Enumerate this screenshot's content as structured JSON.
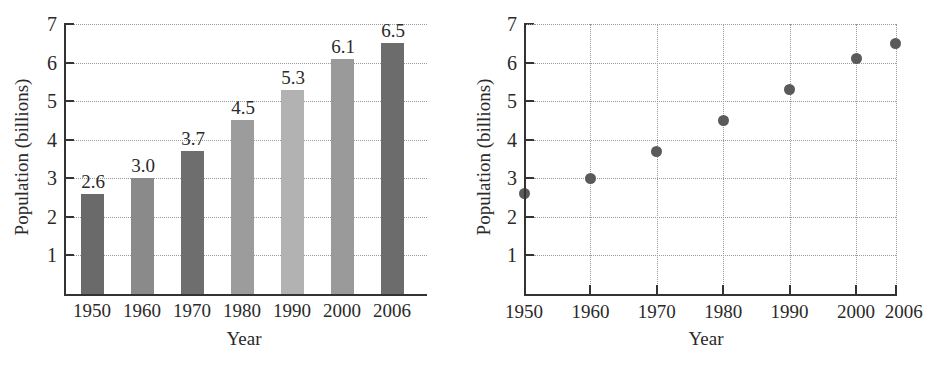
{
  "chart_data": [
    {
      "type": "bar",
      "title": "",
      "xlabel": "Year",
      "ylabel": "Population (billions)",
      "categories": [
        "1950",
        "1960",
        "1970",
        "1980",
        "1990",
        "2000",
        "2006"
      ],
      "values": [
        2.6,
        3.0,
        3.7,
        4.5,
        5.3,
        6.1,
        6.5
      ],
      "data_labels": [
        "2.6",
        "3.0",
        "3.7",
        "4.5",
        "5.3",
        "6.1",
        "6.5"
      ],
      "bar_colors": [
        "#6a6a6a",
        "#8a8a8a",
        "#6e6e6e",
        "#9c9c9c",
        "#b2b2b2",
        "#9a9a9a",
        "#6c6c6c"
      ],
      "ylim": [
        0,
        7
      ],
      "yticks": [
        "1",
        "2",
        "3",
        "4",
        "5",
        "6",
        "7"
      ],
      "grid": "horizontal dotted",
      "legend": null
    },
    {
      "type": "scatter",
      "title": "",
      "xlabel": "Year",
      "ylabel": "Population (billions)",
      "x": [
        1950,
        1960,
        1970,
        1980,
        1990,
        2000,
        2006
      ],
      "y": [
        2.6,
        3.0,
        3.7,
        4.5,
        5.3,
        6.1,
        6.5
      ],
      "xticks": [
        "1950",
        "1960",
        "1970",
        "1980",
        "1990",
        "2000",
        "2006"
      ],
      "yticks": [
        "1",
        "2",
        "3",
        "4",
        "5",
        "6",
        "7"
      ],
      "xlim": [
        1950,
        2006
      ],
      "ylim": [
        0,
        7
      ],
      "marker_color": "#5a5a5a",
      "grid": "both dotted",
      "legend": null
    }
  ]
}
